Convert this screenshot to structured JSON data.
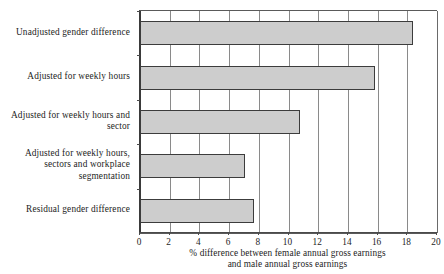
{
  "chart_data": {
    "type": "bar",
    "orientation": "horizontal",
    "title": "",
    "subtitle": "",
    "xlabel_line1": "% difference between female annual gross earnings",
    "xlabel_line2": "and male annual gross earnings",
    "ylabel": "",
    "categories": [
      "Unadjusted gender difference",
      "Adjusted for weekly hours",
      "Adjusted for weekly hours and sector",
      "Adjusted for weekly hours, sectors and workplace segmentation",
      "Residual gender difference"
    ],
    "category_lines": [
      [
        "Unadjusted gender difference"
      ],
      [
        "Adjusted for weekly hours"
      ],
      [
        "Adjusted for weekly hours and",
        "sector"
      ],
      [
        "Adjusted for weekly hours,",
        "sectors and workplace",
        "segmentation"
      ],
      [
        "Residual gender difference"
      ]
    ],
    "values": [
      18.4,
      15.8,
      10.8,
      7.1,
      7.7
    ],
    "xlim": [
      0,
      20
    ],
    "xticks": [
      0,
      2,
      4,
      6,
      8,
      10,
      12,
      14,
      16,
      18,
      20
    ],
    "xtick_labels": [
      "0",
      "2",
      "4",
      "6",
      "8",
      "10",
      "12",
      "14",
      "16",
      "18",
      "20"
    ],
    "grid": "vertical",
    "legend": "none",
    "bar_fill_color": "#cdcdcd",
    "bar_border_color": "#3c3c3c",
    "gridline_color": "#8a8a8a",
    "axis_color": "#4a4a4a",
    "background_color": "#ffffff",
    "text_color": "#1d1d1d"
  }
}
